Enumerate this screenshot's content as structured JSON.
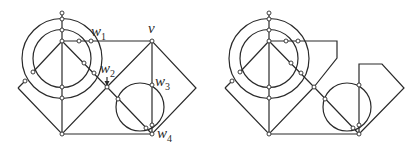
{
  "figure": {
    "panels": [
      {
        "id": "left",
        "description": "Plane graph with labeled vertices"
      },
      {
        "id": "right",
        "description": "Modified graph without labels"
      }
    ],
    "labels": {
      "w1": {
        "base": "w",
        "sub": "1"
      },
      "w2": {
        "base": "w",
        "sub": "2"
      },
      "w3": {
        "base": "w",
        "sub": "3"
      },
      "w4": {
        "base": "w",
        "sub": "4"
      },
      "v": {
        "base": "v",
        "sub": ""
      }
    },
    "colors": {
      "stroke": "#2a2a2a",
      "node_fill": "#ffffff",
      "background": "#ffffff"
    }
  }
}
